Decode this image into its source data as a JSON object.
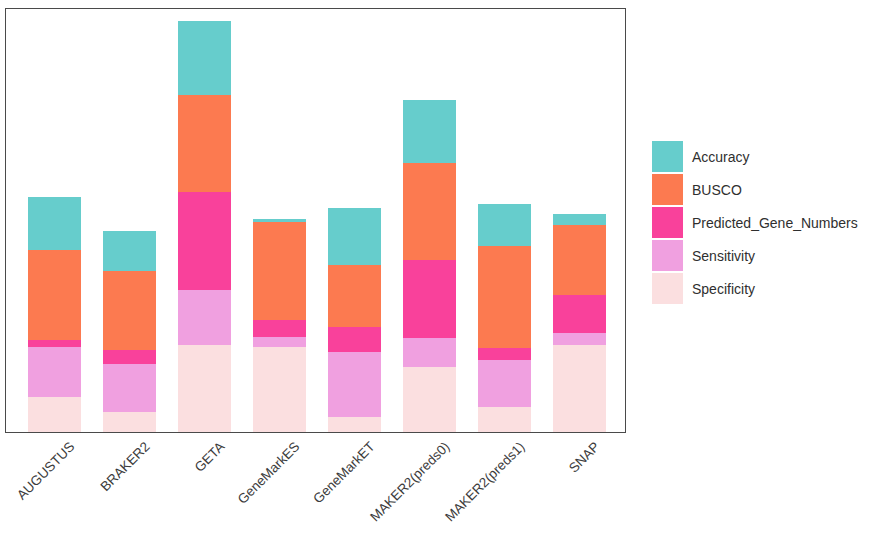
{
  "chart": {
    "type": "bar",
    "title": "",
    "xlabel": "",
    "ylabel": ""
  },
  "chart_data": {
    "type": "bar",
    "subtype": "stacked-bar",
    "title": "",
    "subtitle": "",
    "xlabel": "",
    "ylabel": "",
    "grid": false,
    "axis_ticks_shown": false,
    "ylim": [
      0,
      5
    ],
    "legend_position": "right",
    "stack_order_bottom_to_top": [
      "Specificity",
      "Sensitivity",
      "Predicted_Gene_Numbers",
      "BUSCO",
      "Accuracy"
    ],
    "categories": [
      "AUGUSTUS",
      "BRAKER2",
      "GETA",
      "GeneMarkES",
      "GeneMarkET",
      "MAKER2(preds0)",
      "MAKER2(preds1)",
      "SNAP"
    ],
    "series": [
      {
        "name": "Specificity",
        "color": "#FBDFE0",
        "values": [
          0.41,
          0.24,
          1.02,
          1.0,
          0.18,
          0.76,
          0.29,
          1.02
        ]
      },
      {
        "name": "Sensitivity",
        "color": "#F0A0E0",
        "values": [
          0.59,
          0.56,
          0.65,
          0.12,
          0.76,
          0.35,
          0.56,
          0.15
        ]
      },
      {
        "name": "Predicted_Gene_Numbers",
        "color": "#F9419B",
        "values": [
          0.08,
          0.16,
          1.15,
          0.2,
          0.29,
          0.91,
          0.14,
          0.44
        ]
      },
      {
        "name": "BUSCO",
        "color": "#FC7A50",
        "values": [
          1.06,
          0.94,
          1.14,
          1.15,
          0.73,
          1.14,
          1.2,
          0.82
        ]
      },
      {
        "name": "Accuracy",
        "color": "#66CDCC",
        "values": [
          0.62,
          0.46,
          0.87,
          0.04,
          0.68,
          0.75,
          0.49,
          0.14
        ]
      }
    ],
    "totals": [
      2.76,
      2.36,
      4.83,
      2.51,
      2.64,
      3.91,
      2.68,
      2.57
    ]
  },
  "legend": {
    "entries": [
      {
        "label": "Accuracy",
        "color": "#66CDCC"
      },
      {
        "label": "BUSCO",
        "color": "#FC7A50"
      },
      {
        "label": "Predicted_Gene_Numbers",
        "color": "#F9419B"
      },
      {
        "label": "Sensitivity",
        "color": "#F0A0E0"
      },
      {
        "label": "Specificity",
        "color": "#FBDFE0"
      }
    ]
  },
  "axis": {
    "frame_color": "#4a4a4a",
    "x_tick_labels": [
      "AUGUSTUS",
      "BRAKER2",
      "GETA",
      "GeneMarkES",
      "GeneMarkET",
      "MAKER2(preds0)",
      "MAKER2(preds1)",
      "SNAP"
    ]
  }
}
